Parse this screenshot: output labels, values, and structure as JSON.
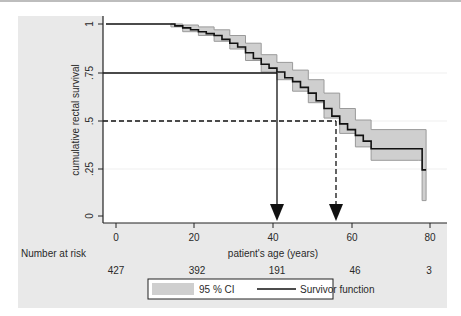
{
  "chart_data": {
    "type": "line",
    "subtype": "kaplan-meier",
    "title": "",
    "xlabel": "patient's age (years)",
    "ylabel": "cumulative rectal survival",
    "xlim": [
      0,
      80
    ],
    "ylim": [
      0,
      1
    ],
    "x_ticks": [
      "0",
      "20",
      "40",
      "60",
      "80"
    ],
    "y_ticks": [
      "0",
      ".25",
      ".5",
      ".75",
      "1"
    ],
    "grid": true,
    "legend_position": "bottom",
    "legend": [
      {
        "label": "95 % CI",
        "style": "gray band"
      },
      {
        "label": "Survivor function",
        "style": "solid black line"
      }
    ],
    "series": [
      {
        "name": "Survivor function",
        "x": [
          0,
          14,
          15,
          17,
          19,
          21,
          23,
          25,
          27,
          29,
          31,
          33,
          35,
          37,
          39,
          41,
          43,
          45,
          47,
          49,
          51,
          53,
          55,
          57,
          59,
          61,
          63,
          65,
          77,
          78,
          79
        ],
        "y": [
          1.0,
          1.0,
          0.99,
          0.98,
          0.97,
          0.96,
          0.95,
          0.94,
          0.92,
          0.9,
          0.88,
          0.85,
          0.82,
          0.79,
          0.77,
          0.75,
          0.72,
          0.7,
          0.67,
          0.64,
          0.6,
          0.56,
          0.52,
          0.48,
          0.45,
          0.42,
          0.39,
          0.35,
          0.35,
          0.24,
          0.24
        ]
      },
      {
        "name": "95 % CI upper",
        "x": [
          14,
          17,
          21,
          25,
          29,
          33,
          37,
          41,
          45,
          49,
          53,
          57,
          61,
          65,
          79
        ],
        "y": [
          1.0,
          0.995,
          0.985,
          0.97,
          0.94,
          0.9,
          0.84,
          0.8,
          0.76,
          0.71,
          0.64,
          0.56,
          0.5,
          0.45,
          0.45
        ]
      },
      {
        "name": "95 % CI lower",
        "x": [
          14,
          17,
          21,
          25,
          29,
          33,
          37,
          41,
          45,
          49,
          53,
          57,
          61,
          65,
          77,
          78,
          79
        ],
        "y": [
          0.985,
          0.96,
          0.94,
          0.91,
          0.87,
          0.81,
          0.75,
          0.71,
          0.65,
          0.59,
          0.51,
          0.43,
          0.36,
          0.29,
          0.29,
          0.08,
          0.08
        ]
      }
    ],
    "annotations": [
      {
        "type": "reference-line",
        "style": "solid",
        "y": 0.75,
        "x": 41,
        "description": "horizontal at .75 to curve, vertical arrow down to x-axis"
      },
      {
        "type": "reference-line",
        "style": "dashed",
        "y": 0.5,
        "x": 56,
        "description": "horizontal at .5 to curve, dashed vertical arrow down to x-axis"
      }
    ],
    "risk_table": {
      "label": "Number at risk",
      "x": [
        0,
        20,
        40,
        60,
        80
      ],
      "values": [
        427,
        392,
        191,
        46,
        3
      ]
    }
  },
  "labels": {
    "xlabel": "patient's age (years)",
    "ylabel": "cumulative rectal survival",
    "risk_label": "Number at risk",
    "x_ticks": [
      "0",
      "20",
      "40",
      "60",
      "80"
    ],
    "y_ticks": [
      "1",
      ".75",
      ".5",
      ".25",
      "0"
    ],
    "risk_values": [
      "427",
      "392",
      "191",
      "46",
      "3"
    ],
    "legend_ci": "95 % CI",
    "legend_survivor": "Survivor function"
  },
  "colors": {
    "panel_bg": "#e9e9e9",
    "plot_bg": "#ffffff",
    "ci_fill": "#cfcfcf",
    "ci_edge": "#9a9a9a",
    "line": "#111111"
  }
}
